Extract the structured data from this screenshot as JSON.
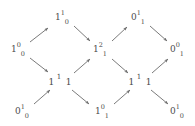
{
  "figure": {
    "type": "directed-graph",
    "width": 195,
    "height": 126,
    "background_color": "#ffffff",
    "text_color": "#4a4a4a",
    "edge_color": "#6b6b6b"
  },
  "nodes": [
    {
      "id": "n-top-left",
      "name": "node-1-sup1-sub0",
      "label": "1^1_0",
      "base": "1",
      "sup": "1",
      "sub": "0",
      "style": "compact",
      "x": 62,
      "y": 18
    },
    {
      "id": "n-top-right",
      "name": "node-0-sup1-sub1",
      "label": "0^1_1",
      "base": "0",
      "sup": "1",
      "sub": "1",
      "style": "compact",
      "x": 138,
      "y": 18
    },
    {
      "id": "n-left",
      "name": "node-1-sup0-sub0",
      "label": "1^0_0",
      "base": "1",
      "sup": "0",
      "sub": "0",
      "style": "compact",
      "x": 18,
      "y": 50
    },
    {
      "id": "n-center",
      "name": "node-1-sup2-sub1",
      "label": "1^2_1",
      "base": "1",
      "sup": "2",
      "sub": "1",
      "style": "compact",
      "x": 100,
      "y": 50
    },
    {
      "id": "n-right",
      "name": "node-0-sup0-sub1",
      "label": "0^0_1",
      "base": "0",
      "sup": "0",
      "sub": "1",
      "style": "compact",
      "x": 177,
      "y": 50
    },
    {
      "id": "n-mid-left",
      "name": "node-1-sup1-sub1-left",
      "label": "1^1_1",
      "base": "1",
      "mid": "1",
      "tail": "1",
      "style": "wide",
      "x": 60,
      "y": 82
    },
    {
      "id": "n-mid-right",
      "name": "node-1-sup1-sub1-right",
      "label": "1^1_1",
      "base": "1",
      "mid": "1",
      "tail": "1",
      "style": "wide",
      "x": 140,
      "y": 82
    },
    {
      "id": "n-bottom-left",
      "name": "node-0-sup1-sub0-left",
      "label": "0^1_0",
      "base": "0",
      "sup": "1",
      "sub": "0",
      "style": "compact",
      "x": 22,
      "y": 112
    },
    {
      "id": "n-bottom-center",
      "name": "node-1-sup0-sub1",
      "label": "1^0_1",
      "base": "1",
      "sup": "0",
      "sub": "1",
      "style": "compact",
      "x": 102,
      "y": 112
    },
    {
      "id": "n-bottom-right",
      "name": "node-0-sup1-sub0-right",
      "label": "0^1_0",
      "base": "0",
      "sup": "1",
      "sub": "0",
      "style": "compact",
      "x": 177,
      "y": 112
    }
  ],
  "edges": [
    {
      "id": "e1",
      "name": "edge-left-to-top-left",
      "from": "n-left",
      "to": "n-top-left",
      "x1": 30,
      "y1": 42,
      "x2": 48,
      "y2": 28
    },
    {
      "id": "e2",
      "name": "edge-left-to-mid-left",
      "from": "n-left",
      "to": "n-mid-left",
      "x1": 30,
      "y1": 58,
      "x2": 48,
      "y2": 72
    },
    {
      "id": "e3",
      "name": "edge-top-left-to-center",
      "from": "n-top-left",
      "to": "n-center",
      "x1": 74,
      "y1": 26,
      "x2": 90,
      "y2": 41
    },
    {
      "id": "e4",
      "name": "edge-mid-left-to-center",
      "from": "n-mid-left",
      "to": "n-center",
      "x1": 74,
      "y1": 73,
      "x2": 90,
      "y2": 59
    },
    {
      "id": "e5",
      "name": "edge-bottom-left-to-mid-left",
      "from": "n-bottom-left",
      "to": "n-mid-left",
      "x1": 34,
      "y1": 104,
      "x2": 50,
      "y2": 90
    },
    {
      "id": "e6",
      "name": "edge-mid-left-to-bottom-center",
      "from": "n-mid-left",
      "to": "n-bottom-center",
      "x1": 72,
      "y1": 90,
      "x2": 89,
      "y2": 104
    },
    {
      "id": "e7",
      "name": "edge-center-to-top-right",
      "from": "n-center",
      "to": "n-top-right",
      "x1": 112,
      "y1": 41,
      "x2": 127,
      "y2": 27
    },
    {
      "id": "e8",
      "name": "edge-center-to-mid-right",
      "from": "n-center",
      "to": "n-mid-right",
      "x1": 112,
      "y1": 59,
      "x2": 128,
      "y2": 73
    },
    {
      "id": "e9",
      "name": "edge-top-right-to-right",
      "from": "n-top-right",
      "to": "n-right",
      "x1": 150,
      "y1": 26,
      "x2": 167,
      "y2": 41
    },
    {
      "id": "e10",
      "name": "edge-mid-right-to-right",
      "from": "n-mid-right",
      "to": "n-right",
      "x1": 152,
      "y1": 73,
      "x2": 168,
      "y2": 59
    },
    {
      "id": "e11",
      "name": "edge-bottom-center-to-mid-right",
      "from": "n-bottom-center",
      "to": "n-mid-right",
      "x1": 114,
      "y1": 104,
      "x2": 130,
      "y2": 90
    },
    {
      "id": "e12",
      "name": "edge-mid-right-to-bottom-right",
      "from": "n-mid-right",
      "to": "n-bottom-right",
      "x1": 151,
      "y1": 90,
      "x2": 168,
      "y2": 104
    }
  ]
}
